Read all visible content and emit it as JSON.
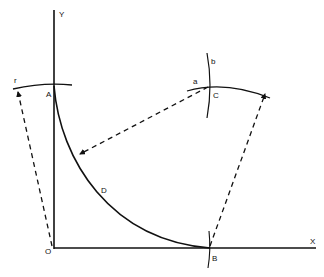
{
  "diagram": {
    "colors": {
      "ink": "#111111",
      "background": "#ffffff"
    },
    "axes": {
      "x_label": "X",
      "y_label": "Y",
      "origin_label": "O"
    },
    "points": {
      "A": "A",
      "B": "B",
      "C": "C",
      "D": "D"
    },
    "arc_labels": {
      "r": "r",
      "a": "a",
      "b": "b"
    }
  }
}
